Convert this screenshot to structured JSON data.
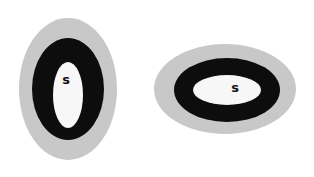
{
  "colors": {
    "background": "#ffffff",
    "outer_ring": "#c8c8c8",
    "middle_ring": "#0d0d0d",
    "inner_core": "#f7f7f7",
    "label": "#111111"
  },
  "figures": [
    {
      "orientation": "vertical",
      "label": "s",
      "outer": {
        "cx": 68,
        "cy": 89,
        "rx": 49,
        "ry": 71
      },
      "middle": {
        "cx": 68,
        "cy": 89,
        "rx": 36,
        "ry": 51
      },
      "inner": {
        "cx": 68,
        "cy": 95,
        "rx": 15,
        "ry": 33
      },
      "label_pos": {
        "x": 66,
        "y": 84
      }
    },
    {
      "orientation": "horizontal",
      "label": "s",
      "outer": {
        "cx": 225,
        "cy": 89,
        "rx": 71,
        "ry": 45
      },
      "middle": {
        "cx": 227,
        "cy": 90,
        "rx": 53,
        "ry": 32
      },
      "inner": {
        "cx": 227,
        "cy": 90,
        "rx": 34,
        "ry": 15
      },
      "label_pos": {
        "x": 235,
        "y": 92
      }
    }
  ]
}
